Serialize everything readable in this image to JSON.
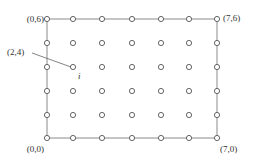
{
  "diagram": {
    "type": "grid-of-points",
    "columns": 7,
    "rows": 6,
    "origin_px": [
      47,
      138
    ],
    "col_x": [
      47,
      73,
      102,
      132,
      161,
      189,
      217
    ],
    "row_y": [
      19,
      43,
      67,
      91,
      115,
      138
    ],
    "point_radius": 2.6,
    "colors": {
      "point_stroke": "#555555",
      "frame": "#8a8a8a",
      "leader": "#666666",
      "text": "#333333",
      "background": "#ffffff"
    },
    "corner_labels": [
      {
        "id": "top-left",
        "text": "(0,6)",
        "x": 44,
        "y": 19,
        "anchor": "end"
      },
      {
        "id": "top-right",
        "text": "(7,6)",
        "x": 223,
        "y": 18,
        "anchor": "start"
      },
      {
        "id": "bottom-left",
        "text": "(0,0)",
        "x": 44,
        "y": 149,
        "anchor": "end"
      },
      {
        "id": "bottom-right",
        "text": "(7,0)",
        "x": 220,
        "y": 149,
        "anchor": "start"
      }
    ],
    "callout": {
      "text": "(2,4)",
      "text_x": 7,
      "text_y": 55,
      "leader_from": [
        32,
        53
      ],
      "leader_to": [
        71,
        67
      ],
      "point_label": "i",
      "point_label_x": 78,
      "point_label_y": 79
    }
  }
}
